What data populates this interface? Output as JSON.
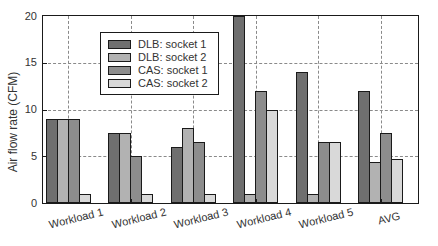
{
  "chart_data": {
    "type": "bar",
    "title": "",
    "xlabel": "",
    "ylabel": "Air flow rate (CFM)",
    "categories": [
      "Workload 1",
      "Workload 2",
      "Workload 3",
      "Workload 4",
      "Workload 5",
      "AVG"
    ],
    "series": [
      {
        "name": "DLB: socket 1",
        "color": "#6f6f6f",
        "values": [
          9,
          7.5,
          6,
          20,
          14,
          12
        ]
      },
      {
        "name": "DLB: socket 2",
        "color": "#b2b2b2",
        "values": [
          9,
          7.5,
          8,
          1,
          1,
          4.4
        ]
      },
      {
        "name": "CAS: socket 1",
        "color": "#8d8d8d",
        "values": [
          9,
          5,
          6.5,
          12,
          6.5,
          7.5
        ]
      },
      {
        "name": "CAS: socket 2",
        "color": "#d9d9d9",
        "values": [
          1,
          1,
          1,
          10,
          6.5,
          4.7
        ]
      }
    ],
    "ylim": [
      0,
      20
    ],
    "yticks": [
      0,
      5,
      10,
      15,
      20
    ],
    "grid": true,
    "legend_position": "top-left",
    "axis_color": "#1a1a1a",
    "gridline_style": "dashed"
  }
}
